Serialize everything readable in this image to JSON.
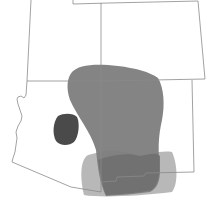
{
  "map": {
    "region": "Four Corners, Southwestern United States",
    "states": [
      "Utah",
      "Colorado",
      "Arizona",
      "New Mexico"
    ],
    "colors": {
      "background": "#ffffff",
      "border": "#8a8a8a",
      "range_primary": "#7d7d7d",
      "range_secondary": "#b4b4b4",
      "range_isolated": "#4a4a4a"
    },
    "ranges": [
      {
        "name": "primary-range",
        "shade": "medium-gray"
      },
      {
        "name": "southern-range",
        "shade": "light-gray"
      },
      {
        "name": "isolated-population",
        "shade": "dark-gray"
      }
    ]
  }
}
